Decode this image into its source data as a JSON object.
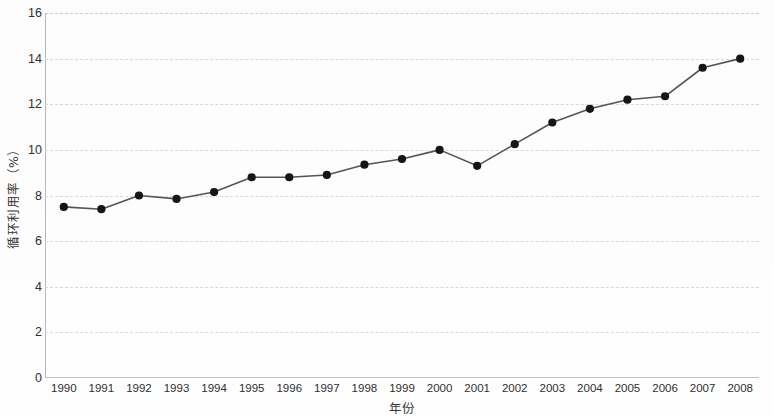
{
  "chart_data": {
    "type": "line",
    "title": "",
    "xlabel": "年份",
    "ylabel": "循环利用率（%）",
    "categories": [
      "1990",
      "1991",
      "1992",
      "1993",
      "1994",
      "1995",
      "1996",
      "1997",
      "1998",
      "1999",
      "2000",
      "2001",
      "2002",
      "2003",
      "2004",
      "2005",
      "2006",
      "2007",
      "2008"
    ],
    "values": [
      7.5,
      7.4,
      8.0,
      7.85,
      8.15,
      8.8,
      8.8,
      8.9,
      9.35,
      9.6,
      10.0,
      9.3,
      10.25,
      11.2,
      11.8,
      12.2,
      12.35,
      13.6,
      14.0
    ],
    "series": [
      {
        "name": "循环利用率",
        "values": [
          7.5,
          7.4,
          8.0,
          7.85,
          8.15,
          8.8,
          8.8,
          8.9,
          9.35,
          9.6,
          10.0,
          9.3,
          10.25,
          11.2,
          11.8,
          12.2,
          12.35,
          13.6,
          14.0
        ]
      }
    ],
    "ylim": [
      0,
      16
    ],
    "yticks": [
      0,
      2,
      4,
      6,
      8,
      10,
      12,
      14,
      16
    ],
    "ytick_labels": [
      "0",
      "2",
      "4",
      "6",
      "8",
      "10",
      "12",
      "14",
      "16"
    ],
    "grid": true,
    "grid_style": "dashed-horizontal",
    "legend": null,
    "legend_position": "none",
    "marker": "filled-circle",
    "line_color": "#555555",
    "marker_color": "#161616",
    "grid_color": "#d9d9d9",
    "axis_color": "#b8b8b8",
    "background_color": "#fefefe"
  },
  "axis": {
    "y_title": "循环利用率（%）",
    "x_title": "年份"
  }
}
